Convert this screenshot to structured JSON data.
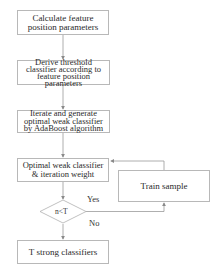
{
  "diagram": {
    "type": "flowchart",
    "nodes": [
      {
        "id": "calc",
        "shape": "rect",
        "lines": [
          "Calculate feature",
          "position parameters"
        ]
      },
      {
        "id": "derive",
        "shape": "rect",
        "lines": [
          "Derive threshold",
          "classifier according to",
          "feature position",
          "parameters"
        ]
      },
      {
        "id": "iterate",
        "shape": "rect",
        "lines": [
          "Iterate and generate",
          "optimal weak  classifier",
          "by AdaBoost algorithm"
        ]
      },
      {
        "id": "optimal",
        "shape": "rect",
        "lines": [
          "Optimal weak classifier",
          "& iteration  weight"
        ]
      },
      {
        "id": "decision",
        "shape": "diamond",
        "text": "n<T"
      },
      {
        "id": "train",
        "shape": "rect",
        "lines": [
          "Train sample"
        ]
      },
      {
        "id": "strong",
        "shape": "rect",
        "lines": [
          "T strong classifiers"
        ]
      }
    ],
    "edges": [
      {
        "from": "calc",
        "to": "derive"
      },
      {
        "from": "derive",
        "to": "iterate"
      },
      {
        "from": "iterate",
        "to": "optimal"
      },
      {
        "from": "optimal",
        "to": "decision"
      },
      {
        "from": "decision",
        "to": "train",
        "label": "Yes"
      },
      {
        "from": "train",
        "to": "optimal"
      },
      {
        "from": "decision",
        "to": "strong",
        "label": "No"
      }
    ],
    "labels": {
      "yes": "Yes",
      "no": "No"
    }
  }
}
